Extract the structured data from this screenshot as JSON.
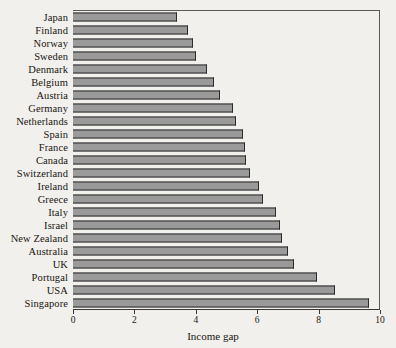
{
  "chart_data": {
    "type": "bar",
    "orientation": "horizontal",
    "title": "",
    "xlabel": "Income gap",
    "ylabel": "",
    "xlim": [
      0,
      10
    ],
    "xticks": [
      0,
      2,
      4,
      6,
      8,
      10
    ],
    "xtick_labels": [
      "0",
      "2",
      "4",
      "6",
      "8",
      "10"
    ],
    "grid": false,
    "legend": null,
    "bar_color": "#9a9a9a",
    "bar_edge_color": "#2b2b2b",
    "background_color": "#f2f0ec",
    "categories": [
      "Japan",
      "Finland",
      "Norway",
      "Sweden",
      "Denmark",
      "Belgium",
      "Austria",
      "Germany",
      "Netherlands",
      "Spain",
      "France",
      "Canada",
      "Switzerland",
      "Ireland",
      "Greece",
      "Italy",
      "Israel",
      "New Zealand",
      "Australia",
      "UK",
      "Portugal",
      "USA",
      "Singapore"
    ],
    "values": [
      3.4,
      3.75,
      3.9,
      4.0,
      4.35,
      4.6,
      4.8,
      5.2,
      5.3,
      5.55,
      5.6,
      5.65,
      5.75,
      6.05,
      6.2,
      6.6,
      6.75,
      6.8,
      7.0,
      7.2,
      7.95,
      8.55,
      9.65
    ]
  }
}
